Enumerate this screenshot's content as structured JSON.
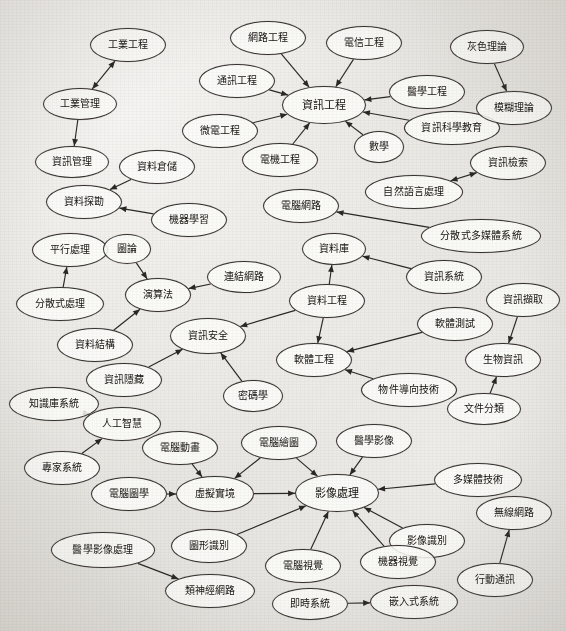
{
  "diagram": {
    "type": "directed-graph",
    "background_color": "#e8e6e2",
    "node_fill": "#fcfbf9",
    "node_stroke": "#35312e",
    "edge_color": "#2a2724",
    "width": 566,
    "height": 631
  },
  "nodes": [
    {
      "id": "n1",
      "label": "工業工程",
      "x": 128,
      "y": 45,
      "rx": 38,
      "ry": 17,
      "fs": 10
    },
    {
      "id": "n2",
      "label": "工業管理",
      "x": 80,
      "y": 104,
      "rx": 37,
      "ry": 16,
      "fs": 10
    },
    {
      "id": "n3",
      "label": "資訊管理",
      "x": 72,
      "y": 162,
      "rx": 37,
      "ry": 16,
      "fs": 10
    },
    {
      "id": "n4",
      "label": "資料倉儲",
      "x": 157,
      "y": 167,
      "rx": 38,
      "ry": 17,
      "fs": 10
    },
    {
      "id": "n5",
      "label": "資料探勘",
      "x": 84,
      "y": 202,
      "rx": 38,
      "ry": 17,
      "fs": 10
    },
    {
      "id": "n6",
      "label": "機器學習",
      "x": 189,
      "y": 220,
      "rx": 38,
      "ry": 17,
      "fs": 10
    },
    {
      "id": "n7",
      "label": "網路工程",
      "x": 268,
      "y": 38,
      "rx": 38,
      "ry": 17,
      "fs": 10
    },
    {
      "id": "n8",
      "label": "通訊工程",
      "x": 237,
      "y": 81,
      "rx": 38,
      "ry": 17,
      "fs": 10
    },
    {
      "id": "n9",
      "label": "微電工程",
      "x": 220,
      "y": 131,
      "rx": 38,
      "ry": 17,
      "fs": 10
    },
    {
      "id": "n10",
      "label": "電機工程",
      "x": 280,
      "y": 160,
      "rx": 38,
      "ry": 17,
      "fs": 10
    },
    {
      "id": "n11",
      "label": "電信工程",
      "x": 364,
      "y": 43,
      "rx": 38,
      "ry": 17,
      "fs": 10
    },
    {
      "id": "n12",
      "label": "資訊工程",
      "x": 324,
      "y": 105,
      "rx": 42,
      "ry": 19,
      "fs": 11
    },
    {
      "id": "n13",
      "label": "醫學工程",
      "x": 427,
      "y": 92,
      "rx": 38,
      "ry": 17,
      "fs": 10
    },
    {
      "id": "n14",
      "label": "資訊科學教育",
      "x": 452,
      "y": 128,
      "rx": 48,
      "ry": 17,
      "fs": 10
    },
    {
      "id": "n15",
      "label": "數學",
      "x": 379,
      "y": 147,
      "rx": 25,
      "ry": 16,
      "fs": 10
    },
    {
      "id": "n16",
      "label": "灰色理論",
      "x": 487,
      "y": 47,
      "rx": 37,
      "ry": 17,
      "fs": 10
    },
    {
      "id": "n17",
      "label": "模糊理論",
      "x": 514,
      "y": 108,
      "rx": 38,
      "ry": 17,
      "fs": 10
    },
    {
      "id": "n18",
      "label": "資訊檢索",
      "x": 508,
      "y": 163,
      "rx": 38,
      "ry": 17,
      "fs": 10
    },
    {
      "id": "n19",
      "label": "自然語言處理",
      "x": 414,
      "y": 192,
      "rx": 49,
      "ry": 17,
      "fs": 10
    },
    {
      "id": "n20",
      "label": "電腦網路",
      "x": 301,
      "y": 206,
      "rx": 38,
      "ry": 17,
      "fs": 10
    },
    {
      "id": "n21",
      "label": "分散式多媒體系統",
      "x": 481,
      "y": 236,
      "rx": 60,
      "ry": 17,
      "fs": 10
    },
    {
      "id": "n22",
      "label": "資料庫",
      "x": 334,
      "y": 249,
      "rx": 32,
      "ry": 16,
      "fs": 10
    },
    {
      "id": "n23",
      "label": "資訊系統",
      "x": 444,
      "y": 277,
      "rx": 38,
      "ry": 17,
      "fs": 10
    },
    {
      "id": "n24",
      "label": "資料工程",
      "x": 327,
      "y": 301,
      "rx": 38,
      "ry": 17,
      "fs": 10
    },
    {
      "id": "n25",
      "label": "資訊擷取",
      "x": 523,
      "y": 300,
      "rx": 37,
      "ry": 17,
      "fs": 10
    },
    {
      "id": "n26",
      "label": "生物資訊",
      "x": 503,
      "y": 360,
      "rx": 38,
      "ry": 17,
      "fs": 10
    },
    {
      "id": "n27",
      "label": "軟體測試",
      "x": 455,
      "y": 324,
      "rx": 38,
      "ry": 17,
      "fs": 10
    },
    {
      "id": "n28",
      "label": "軟體工程",
      "x": 314,
      "y": 360,
      "rx": 38,
      "ry": 17,
      "fs": 10
    },
    {
      "id": "n29",
      "label": "物件導向技術",
      "x": 409,
      "y": 390,
      "rx": 48,
      "ry": 17,
      "fs": 10
    },
    {
      "id": "n30",
      "label": "文件分類",
      "x": 484,
      "y": 409,
      "rx": 37,
      "ry": 16,
      "fs": 10
    },
    {
      "id": "n31",
      "label": "平行處理",
      "x": 70,
      "y": 250,
      "rx": 38,
      "ry": 17,
      "fs": 10
    },
    {
      "id": "n32",
      "label": "圖論",
      "x": 127,
      "y": 249,
      "rx": 24,
      "ry": 15,
      "fs": 10
    },
    {
      "id": "n33",
      "label": "連結網路",
      "x": 244,
      "y": 277,
      "rx": 37,
      "ry": 16,
      "fs": 10
    },
    {
      "id": "n34",
      "label": "演算法",
      "x": 158,
      "y": 295,
      "rx": 33,
      "ry": 17,
      "fs": 10
    },
    {
      "id": "n35",
      "label": "分散式處理",
      "x": 60,
      "y": 304,
      "rx": 44,
      "ry": 17,
      "fs": 10
    },
    {
      "id": "n36",
      "label": "資料結構",
      "x": 95,
      "y": 345,
      "rx": 38,
      "ry": 17,
      "fs": 10
    },
    {
      "id": "n37",
      "label": "資訊安全",
      "x": 208,
      "y": 336,
      "rx": 38,
      "ry": 18,
      "fs": 10
    },
    {
      "id": "n38",
      "label": "密碼學",
      "x": 253,
      "y": 396,
      "rx": 30,
      "ry": 16,
      "fs": 10
    },
    {
      "id": "n39",
      "label": "資訊隱藏",
      "x": 124,
      "y": 380,
      "rx": 38,
      "ry": 17,
      "fs": 10
    },
    {
      "id": "n40",
      "label": "知識庫系統",
      "x": 54,
      "y": 404,
      "rx": 45,
      "ry": 17,
      "fs": 10
    },
    {
      "id": "n41",
      "label": "人工智慧",
      "x": 122,
      "y": 424,
      "rx": 39,
      "ry": 17,
      "fs": 10
    },
    {
      "id": "n42",
      "label": "專家系統",
      "x": 62,
      "y": 468,
      "rx": 38,
      "ry": 17,
      "fs": 10
    },
    {
      "id": "n43",
      "label": "電腦動畫",
      "x": 180,
      "y": 448,
      "rx": 38,
      "ry": 17,
      "fs": 10
    },
    {
      "id": "n44",
      "label": "電腦繪圖",
      "x": 279,
      "y": 443,
      "rx": 38,
      "ry": 17,
      "fs": 10
    },
    {
      "id": "n45",
      "label": "醫學影像",
      "x": 374,
      "y": 441,
      "rx": 38,
      "ry": 17,
      "fs": 10
    },
    {
      "id": "n46",
      "label": "虛擬實境",
      "x": 215,
      "y": 494,
      "rx": 39,
      "ry": 18,
      "fs": 10
    },
    {
      "id": "n47",
      "label": "電腦圖學",
      "x": 129,
      "y": 494,
      "rx": 38,
      "ry": 17,
      "fs": 10
    },
    {
      "id": "n48",
      "label": "影像處理",
      "x": 337,
      "y": 493,
      "rx": 42,
      "ry": 19,
      "fs": 11
    },
    {
      "id": "n49",
      "label": "多媒體技術",
      "x": 478,
      "y": 480,
      "rx": 44,
      "ry": 17,
      "fs": 10
    },
    {
      "id": "n50",
      "label": "無線網路",
      "x": 514,
      "y": 513,
      "rx": 38,
      "ry": 17,
      "fs": 10
    },
    {
      "id": "n51",
      "label": "影像識別",
      "x": 427,
      "y": 541,
      "rx": 38,
      "ry": 17,
      "fs": 10
    },
    {
      "id": "n52",
      "label": "醫學影像處理",
      "x": 103,
      "y": 550,
      "rx": 52,
      "ry": 18,
      "fs": 10
    },
    {
      "id": "n53",
      "label": "圖形識別",
      "x": 209,
      "y": 546,
      "rx": 38,
      "ry": 17,
      "fs": 10
    },
    {
      "id": "n54",
      "label": "電腦視覺",
      "x": 303,
      "y": 566,
      "rx": 38,
      "ry": 17,
      "fs": 10
    },
    {
      "id": "n55",
      "label": "機器視覺",
      "x": 398,
      "y": 562,
      "rx": 38,
      "ry": 17,
      "fs": 10
    },
    {
      "id": "n56",
      "label": "行動通訊",
      "x": 495,
      "y": 580,
      "rx": 38,
      "ry": 17,
      "fs": 10
    },
    {
      "id": "n57",
      "label": "即時系統",
      "x": 310,
      "y": 604,
      "rx": 38,
      "ry": 16,
      "fs": 10
    },
    {
      "id": "n58",
      "label": "嵌入式系統",
      "x": 414,
      "y": 602,
      "rx": 44,
      "ry": 17,
      "fs": 10
    },
    {
      "id": "n59",
      "label": "類神經網路",
      "x": 210,
      "y": 591,
      "rx": 45,
      "ry": 17,
      "fs": 10
    }
  ],
  "edges": [
    {
      "from": "n2",
      "to": "n1",
      "dir": "both"
    },
    {
      "from": "n2",
      "to": "n3",
      "dir": "to"
    },
    {
      "from": "n4",
      "to": "n5",
      "dir": "to"
    },
    {
      "from": "n6",
      "to": "n5",
      "dir": "to"
    },
    {
      "from": "n7",
      "to": "n12",
      "dir": "to"
    },
    {
      "from": "n8",
      "to": "n12",
      "dir": "to"
    },
    {
      "from": "n9",
      "to": "n12",
      "dir": "to"
    },
    {
      "from": "n10",
      "to": "n12",
      "dir": "to"
    },
    {
      "from": "n11",
      "to": "n12",
      "dir": "to"
    },
    {
      "from": "n13",
      "to": "n12",
      "dir": "to"
    },
    {
      "from": "n14",
      "to": "n12",
      "dir": "to"
    },
    {
      "from": "n15",
      "to": "n12",
      "dir": "to"
    },
    {
      "from": "n16",
      "to": "n17",
      "dir": "to"
    },
    {
      "from": "n18",
      "to": "n19",
      "dir": "both"
    },
    {
      "from": "n21",
      "to": "n20",
      "dir": "to"
    },
    {
      "from": "n23",
      "to": "n22",
      "dir": "to"
    },
    {
      "from": "n24",
      "to": "n22",
      "dir": "to"
    },
    {
      "from": "n24",
      "to": "n28",
      "dir": "to"
    },
    {
      "from": "n24",
      "to": "n37",
      "dir": "to"
    },
    {
      "from": "n25",
      "to": "n26",
      "dir": "to"
    },
    {
      "from": "n27",
      "to": "n28",
      "dir": "to"
    },
    {
      "from": "n29",
      "to": "n28",
      "dir": "to"
    },
    {
      "from": "n30",
      "to": "n26",
      "dir": "to"
    },
    {
      "from": "n32",
      "to": "n34",
      "dir": "to"
    },
    {
      "from": "n33",
      "to": "n34",
      "dir": "to"
    },
    {
      "from": "n35",
      "to": "n31",
      "dir": "to"
    },
    {
      "from": "n36",
      "to": "n34",
      "dir": "to"
    },
    {
      "from": "n38",
      "to": "n37",
      "dir": "to"
    },
    {
      "from": "n39",
      "to": "n37",
      "dir": "to"
    },
    {
      "from": "n40",
      "to": "n41",
      "dir": "to"
    },
    {
      "from": "n42",
      "to": "n41",
      "dir": "to"
    },
    {
      "from": "n43",
      "to": "n46",
      "dir": "to"
    },
    {
      "from": "n44",
      "to": "n46",
      "dir": "to"
    },
    {
      "from": "n44",
      "to": "n48",
      "dir": "to"
    },
    {
      "from": "n45",
      "to": "n48",
      "dir": "to"
    },
    {
      "from": "n46",
      "to": "n48",
      "dir": "to"
    },
    {
      "from": "n47",
      "to": "n46",
      "dir": "to"
    },
    {
      "from": "n49",
      "to": "n48",
      "dir": "to"
    },
    {
      "from": "n51",
      "to": "n48",
      "dir": "to"
    },
    {
      "from": "n52",
      "to": "n59",
      "dir": "to"
    },
    {
      "from": "n53",
      "to": "n48",
      "dir": "to"
    },
    {
      "from": "n54",
      "to": "n48",
      "dir": "to"
    },
    {
      "from": "n55",
      "to": "n48",
      "dir": "to"
    },
    {
      "from": "n56",
      "to": "n50",
      "dir": "to"
    },
    {
      "from": "n57",
      "to": "n58",
      "dir": "to"
    }
  ]
}
